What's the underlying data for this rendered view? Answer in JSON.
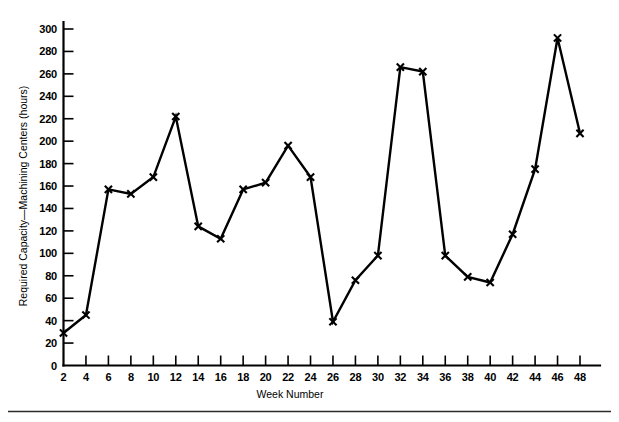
{
  "chart_data": {
    "type": "line",
    "title": "",
    "subtitle": "",
    "xlabel": "Week Number",
    "ylabel": "Required Capacity—Machining Centers (hours)",
    "x": [
      2,
      4,
      6,
      8,
      10,
      12,
      14,
      16,
      18,
      20,
      22,
      24,
      26,
      28,
      30,
      32,
      34,
      36,
      38,
      40,
      42,
      44,
      46,
      48
    ],
    "values": [
      29,
      45,
      157,
      153,
      168,
      222,
      124,
      113,
      157,
      163,
      196,
      168,
      39,
      76,
      98,
      266,
      262,
      98,
      79,
      74,
      117,
      175,
      292,
      207
    ],
    "series": [
      {
        "name": "Required Capacity",
        "values": [
          29,
          45,
          157,
          153,
          168,
          222,
          124,
          113,
          157,
          163,
          196,
          168,
          39,
          76,
          98,
          266,
          262,
          98,
          79,
          74,
          117,
          175,
          292,
          207
        ]
      }
    ],
    "xlim": [
      2,
      48
    ],
    "ylim": [
      0,
      310
    ],
    "xticks": [
      2,
      4,
      6,
      8,
      10,
      12,
      14,
      16,
      18,
      20,
      22,
      24,
      26,
      28,
      30,
      32,
      34,
      36,
      38,
      40,
      42,
      44,
      46,
      48
    ],
    "xtick_labels": [
      "2",
      "4",
      "6",
      "8",
      "10",
      "12",
      "14",
      "16",
      "18",
      "20",
      "22",
      "24",
      "26",
      "28",
      "30",
      "32",
      "34",
      "36",
      "38",
      "40",
      "42",
      "44",
      "46",
      "48"
    ],
    "yticks": [
      0,
      20,
      40,
      60,
      80,
      100,
      120,
      140,
      160,
      180,
      200,
      220,
      240,
      260,
      280,
      300
    ],
    "ytick_labels": [
      "0",
      "20",
      "40",
      "60",
      "80",
      "100",
      "120",
      "140",
      "160",
      "180",
      "200",
      "220",
      "240",
      "260",
      "280",
      "300"
    ],
    "grid": false,
    "legend": false,
    "legend_position": "none",
    "marker": "x",
    "line_color": "#000000",
    "background_color": "#ffffff",
    "annotations": []
  }
}
